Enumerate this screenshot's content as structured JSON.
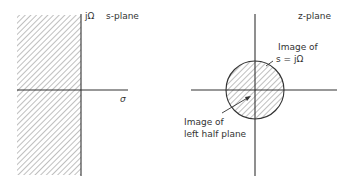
{
  "s_plane": {
    "title": "s-plane",
    "imag_axis_label": "jΩ",
    "real_axis_label": "σ",
    "shaded_region": "left half plane"
  },
  "z_plane": {
    "title": "z-plane",
    "annotation_unit_circle": {
      "line1": "Image of",
      "line2": "s = jΩ"
    },
    "annotation_interior": {
      "line1": "Image of",
      "line2": "left half plane"
    }
  },
  "colors": {
    "ink": "#333333",
    "hatch": "#888888",
    "background": "#ffffff"
  }
}
